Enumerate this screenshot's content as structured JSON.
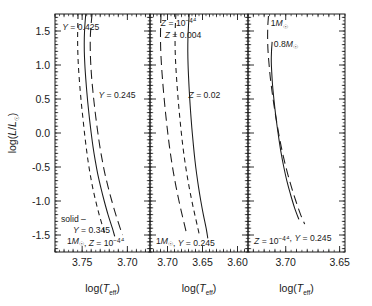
{
  "figure": {
    "width": 372,
    "height": 306,
    "background": "#ffffff",
    "ink_color": "#1a1a1a"
  },
  "chart_data": {
    "type": "line",
    "title": "",
    "subtitle": "",
    "n_panels": 3,
    "shared_ylabel": "log(L/L☉)",
    "shared_xlabel": "log(T_eff)",
    "ylim": [
      -1.75,
      1.75
    ],
    "yticks": [
      -1.5,
      -1.0,
      -0.5,
      0.0,
      0.5,
      1.0,
      1.5
    ],
    "ytick_labels": [
      "-1.5",
      "-1.0",
      "-0.5",
      "0.0",
      "0.5",
      "1.0",
      "1.5"
    ],
    "y_minor_interval": 0.1,
    "x_axis_inverted": true,
    "grid": false,
    "legend": "inline curve annotations",
    "panels": [
      {
        "index": 0,
        "xlim": [
          3.78,
          3.675
        ],
        "xticks": [
          3.75,
          3.7
        ],
        "xtick_labels": [
          "3.75",
          "3.70"
        ],
        "x_minor_interval": 0.01,
        "xlabel": "log(T_eff)",
        "footer_lines": [
          "solid –",
          "Y = 0.345",
          "1M☉, Z = 10⁻⁴"
        ],
        "curves": [
          {
            "name": "Y = 0.425",
            "style": "dashed-short",
            "label": "Y = 0.425",
            "label_x": 3.772,
            "label_y": 1.52,
            "points": [
              [
                3.7545,
                1.75
              ],
              [
                3.7548,
                1.6
              ],
              [
                3.755,
                1.4
              ],
              [
                3.7548,
                1.2
              ],
              [
                3.7542,
                1.0
              ],
              [
                3.7532,
                0.8
              ],
              [
                3.752,
                0.6
              ],
              [
                3.7506,
                0.4
              ],
              [
                3.749,
                0.2
              ],
              [
                3.7474,
                0.0
              ],
              [
                3.7456,
                -0.2
              ],
              [
                3.7436,
                -0.4
              ],
              [
                3.7412,
                -0.6
              ],
              [
                3.7384,
                -0.8
              ],
              [
                3.735,
                -1.0
              ],
              [
                3.7312,
                -1.2
              ],
              [
                3.7268,
                -1.4
              ],
              [
                3.724,
                -1.52
              ]
            ]
          },
          {
            "name": "Y = 0.345",
            "style": "solid",
            "label": "",
            "points": [
              [
                3.746,
                1.75
              ],
              [
                3.747,
                1.58
              ],
              [
                3.7476,
                1.4
              ],
              [
                3.7476,
                1.2
              ],
              [
                3.747,
                1.0
              ],
              [
                3.746,
                0.8
              ],
              [
                3.7448,
                0.6
              ],
              [
                3.7434,
                0.4
              ],
              [
                3.7418,
                0.2
              ],
              [
                3.74,
                0.0
              ],
              [
                3.738,
                -0.2
              ],
              [
                3.7356,
                -0.4
              ],
              [
                3.7328,
                -0.6
              ],
              [
                3.7294,
                -0.8
              ],
              [
                3.7256,
                -1.0
              ],
              [
                3.7214,
                -1.2
              ],
              [
                3.7166,
                -1.4
              ],
              [
                3.714,
                -1.52
              ]
            ]
          },
          {
            "name": "Y = 0.245",
            "style": "dashed-long",
            "label": "Y = 0.245",
            "label_x": 3.732,
            "label_y": 0.52,
            "points": [
              [
                3.739,
                1.75
              ],
              [
                3.7402,
                1.58
              ],
              [
                3.741,
                1.4
              ],
              [
                3.741,
                1.2
              ],
              [
                3.7404,
                1.0
              ],
              [
                3.7394,
                0.8
              ],
              [
                3.738,
                0.6
              ],
              [
                3.7364,
                0.4
              ],
              [
                3.7346,
                0.2
              ],
              [
                3.7326,
                0.0
              ],
              [
                3.7304,
                -0.2
              ],
              [
                3.7278,
                -0.4
              ],
              [
                3.7248,
                -0.6
              ],
              [
                3.7212,
                -0.8
              ],
              [
                3.7172,
                -1.0
              ],
              [
                3.7128,
                -1.2
              ],
              [
                3.708,
                -1.4
              ],
              [
                3.7054,
                -1.5
              ]
            ]
          }
        ]
      },
      {
        "index": 1,
        "xlim": [
          3.725,
          3.585
        ],
        "xticks": [
          3.7,
          3.65,
          3.6
        ],
        "xtick_labels": [
          "3.70",
          "3.65",
          "3.60"
        ],
        "x_minor_interval": 0.01,
        "xlabel": "log(T_eff)",
        "footer_lines": [
          "1M☉, Y = 0.245"
        ],
        "curves": [
          {
            "name": "Z = 10^-4",
            "style": "dashed-long",
            "label": "Z = 10⁻⁴",
            "label_x": 3.7095,
            "label_y": 1.57,
            "points": [
              [
                3.7092,
                1.75
              ],
              [
                3.7098,
                1.58
              ],
              [
                3.71,
                1.4
              ],
              [
                3.7096,
                1.2
              ],
              [
                3.7086,
                1.0
              ],
              [
                3.7072,
                0.8
              ],
              [
                3.7056,
                0.6
              ],
              [
                3.7038,
                0.4
              ],
              [
                3.7018,
                0.2
              ],
              [
                3.6996,
                0.0
              ],
              [
                3.6972,
                -0.2
              ],
              [
                3.6944,
                -0.4
              ],
              [
                3.6912,
                -0.6
              ],
              [
                3.6876,
                -0.8
              ],
              [
                3.6836,
                -1.0
              ],
              [
                3.6792,
                -1.2
              ],
              [
                3.6746,
                -1.4
              ],
              [
                3.6722,
                -1.5
              ]
            ]
          },
          {
            "name": "Z = 0.004",
            "style": "dashed-short",
            "label": "Z = 0.004",
            "label_x": 3.704,
            "label_y": 1.4,
            "points": [
              [
                3.688,
                1.75
              ],
              [
                3.6888,
                1.58
              ],
              [
                3.6892,
                1.4
              ],
              [
                3.689,
                1.2
              ],
              [
                3.6882,
                1.0
              ],
              [
                3.687,
                0.8
              ],
              [
                3.6856,
                0.6
              ],
              [
                3.684,
                0.4
              ],
              [
                3.6822,
                0.2
              ],
              [
                3.6802,
                0.0
              ],
              [
                3.678,
                -0.2
              ],
              [
                3.6754,
                -0.4
              ],
              [
                3.6724,
                -0.6
              ],
              [
                3.669,
                -0.8
              ],
              [
                3.6652,
                -1.0
              ],
              [
                3.661,
                -1.2
              ],
              [
                3.6566,
                -1.4
              ],
              [
                3.6544,
                -1.5
              ]
            ]
          },
          {
            "name": "Z = 0.02",
            "style": "solid",
            "label": "Z = 0.02",
            "label_x": 3.67,
            "label_y": 0.52,
            "points": [
              [
                3.669,
                1.75
              ],
              [
                3.67,
                1.58
              ],
              [
                3.6708,
                1.4
              ],
              [
                3.671,
                1.2
              ],
              [
                3.6706,
                1.0
              ],
              [
                3.6698,
                0.8
              ],
              [
                3.6688,
                0.6
              ],
              [
                3.6676,
                0.4
              ],
              [
                3.6662,
                0.2
              ],
              [
                3.6646,
                0.0
              ],
              [
                3.6628,
                -0.2
              ],
              [
                3.6608,
                -0.4
              ],
              [
                3.6584,
                -0.6
              ],
              [
                3.6556,
                -0.8
              ],
              [
                3.6524,
                -1.0
              ],
              [
                3.6488,
                -1.2
              ],
              [
                3.6448,
                -1.4
              ],
              [
                3.6424,
                -1.55
              ]
            ]
          }
        ]
      },
      {
        "index": 2,
        "xlim": [
          3.735,
          3.645
        ],
        "xticks": [
          3.7,
          3.65
        ],
        "xtick_labels": [
          "3.70",
          "3.65"
        ],
        "x_minor_interval": 0.01,
        "xlabel": "log(T_eff)",
        "footer_lines": [
          "Z = 10⁻⁴, Y = 0.245"
        ],
        "curves": [
          {
            "name": "1 Msun",
            "style": "dashed-long",
            "label": "1M☉",
            "label_x": 3.714,
            "label_y": 1.57,
            "points": [
              [
                3.716,
                1.72
              ],
              [
                3.7166,
                1.58
              ],
              [
                3.7168,
                1.4
              ],
              [
                3.7164,
                1.2
              ],
              [
                3.7154,
                1.0
              ],
              [
                3.7142,
                0.8
              ],
              [
                3.7126,
                0.6
              ],
              [
                3.7108,
                0.4
              ],
              [
                3.7088,
                0.2
              ],
              [
                3.7066,
                0.0
              ],
              [
                3.7042,
                -0.2
              ],
              [
                3.7014,
                -0.4
              ],
              [
                3.6982,
                -0.6
              ],
              [
                3.6946,
                -0.8
              ],
              [
                3.6906,
                -1.0
              ],
              [
                3.6862,
                -1.2
              ],
              [
                3.6824,
                -1.34
              ]
            ]
          },
          {
            "name": "0.8 Msun",
            "style": "solid",
            "label": "0.8M☉",
            "label_x": 3.711,
            "label_y": 1.27,
            "points": [
              [
                3.7126,
                1.34
              ],
              [
                3.7132,
                1.2
              ],
              [
                3.7134,
                1.05
              ],
              [
                3.713,
                0.9
              ],
              [
                3.7122,
                0.7
              ],
              [
                3.711,
                0.5
              ],
              [
                3.7096,
                0.3
              ],
              [
                3.708,
                0.1
              ],
              [
                3.7062,
                -0.1
              ],
              [
                3.7042,
                -0.3
              ],
              [
                3.7018,
                -0.5
              ],
              [
                3.699,
                -0.7
              ],
              [
                3.6956,
                -0.9
              ],
              [
                3.6918,
                -1.1
              ],
              [
                3.6878,
                -1.27
              ]
            ]
          }
        ]
      }
    ]
  },
  "labels": {
    "ylabel_main": "log(L/L",
    "ylabel_sun": "☉",
    "ylabel_close": ")",
    "xlabel_prefix": "log(T",
    "xlabel_sub": "eff",
    "xlabel_suffix": ")"
  }
}
